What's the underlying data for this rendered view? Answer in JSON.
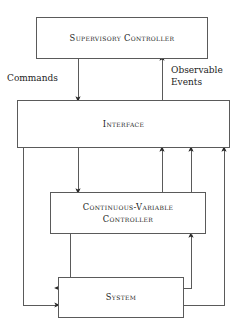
{
  "diagram": {
    "type": "block-diagram",
    "background_color": "#ffffff",
    "line_color": "#5a5a5a",
    "text_color": "#1c1c1c",
    "nodes": [
      {
        "id": "supervisory",
        "label": "Supervisory Controller",
        "x": 36,
        "y": 17,
        "width": 172,
        "height": 42
      },
      {
        "id": "interface",
        "label": "Interface",
        "x": 17,
        "y": 100,
        "width": 213,
        "height": 48
      },
      {
        "id": "cvc",
        "label": "Continuous-Variable\nController",
        "x": 50,
        "y": 192,
        "width": 156,
        "height": 42
      },
      {
        "id": "system",
        "label": "System",
        "x": 58,
        "y": 277,
        "width": 126,
        "height": 41
      }
    ],
    "edge_labels": [
      {
        "id": "commands",
        "text": "Commands"
      },
      {
        "id": "observable_events",
        "text": "Observable\nEvents"
      }
    ],
    "edges": [
      {
        "from": "supervisory",
        "to": "interface",
        "label": "Commands",
        "direction": "down"
      },
      {
        "from": "interface",
        "to": "supervisory",
        "label": "Observable Events",
        "direction": "up"
      },
      {
        "from": "interface",
        "to": "cvc",
        "direction": "down"
      },
      {
        "from": "cvc",
        "to": "interface",
        "direction": "up"
      },
      {
        "from": "interface",
        "to": "system",
        "direction": "down"
      },
      {
        "from": "cvc",
        "to": "system",
        "direction": "down"
      },
      {
        "from": "system",
        "to": "cvc",
        "direction": "up"
      },
      {
        "from": "system",
        "to": "interface",
        "direction": "up"
      }
    ]
  }
}
